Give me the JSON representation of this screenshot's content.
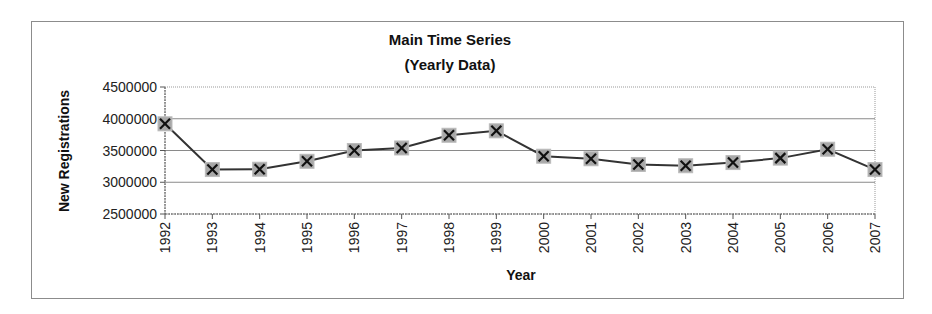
{
  "chart_data": {
    "type": "line",
    "title": "Main Time Series",
    "subtitle": "(Yearly Data)",
    "xlabel": "Year",
    "ylabel": "New Registrations",
    "categories": [
      "1992",
      "1993",
      "1994",
      "1995",
      "1996",
      "1997",
      "1998",
      "1999",
      "2000",
      "2001",
      "2002",
      "2003",
      "2004",
      "2005",
      "2006",
      "2007"
    ],
    "series": [
      {
        "name": "New Registrations",
        "marker": "x-on-gray-square",
        "values": [
          3920000,
          3200000,
          3205000,
          3330000,
          3500000,
          3540000,
          3740000,
          3810000,
          3410000,
          3370000,
          3280000,
          3260000,
          3310000,
          3380000,
          3520000,
          3200000
        ]
      }
    ],
    "ylim": [
      2500000,
      4500000
    ],
    "yticks": [
      "2500000",
      "3000000",
      "3500000",
      "4000000",
      "4500000"
    ],
    "grid": true,
    "legend": "none"
  },
  "colors": {
    "line": "#333333",
    "marker_fill": "#a8a8a8",
    "gridline": "#8a8a8a",
    "frame": "#8c8c8c"
  }
}
